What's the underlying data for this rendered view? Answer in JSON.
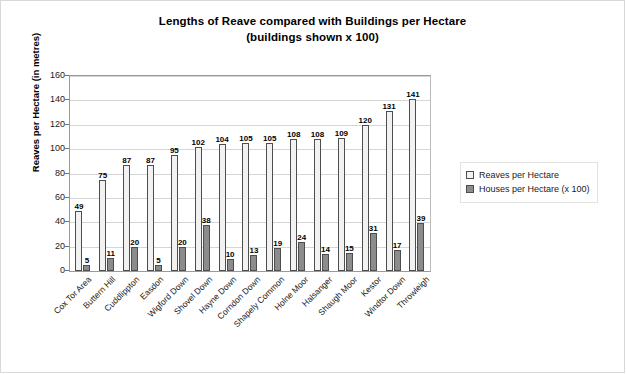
{
  "chart_data": {
    "type": "bar",
    "title": "Lengths of Reave compared with Buildings per Hectare",
    "subtitle": "(buildings shown x 100)",
    "xlabel": "",
    "ylabel": "Reaves per Hectare (in metres)",
    "ylim": [
      0,
      160
    ],
    "ytick_step": 20,
    "yticks": [
      160,
      140,
      120,
      100,
      80,
      60,
      40,
      20,
      0
    ],
    "grid": "horizontal",
    "legend_position": "right",
    "categories": [
      "Cox Tor Area",
      "Buttern Hill",
      "Cuddlippton",
      "Easdon",
      "Wigford Down",
      "Shovel Down",
      "Hayne Down",
      "Corndon Down",
      "Shapely Common",
      "Holne Moor",
      "Halsanger",
      "Shaugh Moor",
      "Kestor",
      "Windtor Down",
      "Throwleigh"
    ],
    "series": [
      {
        "name": "Reaves per Hectare",
        "color": "#f2f2f2",
        "values": [
          49,
          75,
          87,
          87,
          95,
          102,
          104,
          105,
          105,
          108,
          108,
          109,
          120,
          131,
          141
        ]
      },
      {
        "name": "Houses per Hectare (x 100)",
        "color": "#8c8c8c",
        "values": [
          5,
          11,
          20,
          5,
          20,
          38,
          10,
          13,
          19,
          24,
          14,
          15,
          31,
          17,
          39
        ]
      }
    ]
  }
}
